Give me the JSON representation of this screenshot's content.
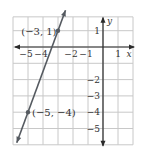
{
  "chart_data": {
    "type": "line",
    "title": "",
    "xlabel": "x",
    "ylabel": "y",
    "xlim": [
      -6,
      2
    ],
    "ylim": [
      -6,
      2
    ],
    "grid": true,
    "x_ticks": [
      {
        "value": -5,
        "label": "−5"
      },
      {
        "value": -4,
        "label": "−4"
      },
      {
        "value": -2,
        "label": "−2"
      },
      {
        "value": -1,
        "label": "−1"
      },
      {
        "value": 1,
        "label": "1"
      }
    ],
    "y_ticks": [
      {
        "value": 1,
        "label": "1"
      },
      {
        "value": -2,
        "label": "−2"
      },
      {
        "value": -3,
        "label": "−3"
      },
      {
        "value": -4,
        "label": "−4"
      },
      {
        "value": -5,
        "label": "−5"
      }
    ],
    "series": [
      {
        "name": "line",
        "color": "#555a60",
        "points": [
          {
            "x": -3,
            "y": 1,
            "label": "(−3, 1)"
          },
          {
            "x": -5,
            "y": -4,
            "label": "(−5, −4)"
          }
        ]
      }
    ]
  }
}
